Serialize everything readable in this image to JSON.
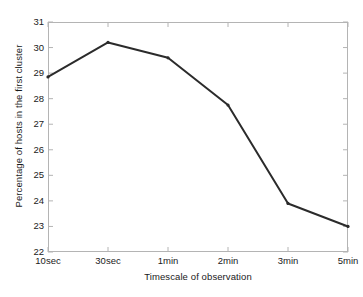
{
  "chart_data": {
    "type": "line",
    "title": "",
    "subtitle": "",
    "xlabel": "Timescale of observation",
    "ylabel": "Percentage of hosts in the first cluster",
    "categories": [
      "10sec",
      "30sec",
      "1min",
      "2min",
      "3min",
      "5min"
    ],
    "values": [
      28.85,
      30.2,
      29.6,
      27.75,
      23.9,
      23.0
    ],
    "series": [
      {
        "name": "Percentage of hosts in the first cluster",
        "values": [
          28.85,
          30.2,
          29.6,
          27.75,
          23.9,
          23.0
        ]
      }
    ],
    "ylim": [
      22,
      31
    ],
    "yticks": [
      22,
      23,
      24,
      25,
      26,
      27,
      28,
      29,
      30,
      31
    ],
    "ytick_labels": [
      "22",
      "23",
      "24",
      "25",
      "26",
      "27",
      "28",
      "29",
      "30",
      "31"
    ],
    "xtick_labels": [
      "10sec",
      "30sec",
      "1min",
      "2min",
      "3min",
      "5min"
    ],
    "grid": false,
    "legend": "none",
    "markers": true,
    "line_color": "#2b2b2b",
    "axis_color": "#b4b4b4",
    "background_color": "#ffffff"
  }
}
